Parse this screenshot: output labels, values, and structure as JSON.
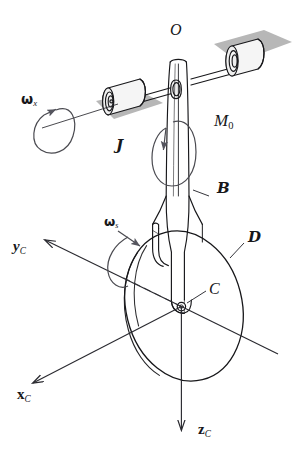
{
  "figure": {
    "background_color": "#ffffff",
    "ink_color": "#17171a",
    "shadow_color": "#b4b4b4",
    "body_fill": "#f7f7f7",
    "arrow_color": "#4a4a50"
  },
  "labels": {
    "origin": {
      "text": "O",
      "style": "italic"
    },
    "moment": {
      "symbol": "M",
      "subscript": "0"
    },
    "frame_j": {
      "text": "J",
      "style": "script"
    },
    "body_b": {
      "text": "B",
      "style": "script"
    },
    "disk_d": {
      "text": "D",
      "style": "script"
    },
    "point_c": {
      "text": "C",
      "style": "italic"
    },
    "omega_x": {
      "symbol": "ω",
      "subscript": "x"
    },
    "omega_s": {
      "symbol": "ω",
      "subscript": "s"
    },
    "axis_x": {
      "symbol": "x",
      "subscript": "C"
    },
    "axis_y": {
      "symbol": "y",
      "subscript": "C"
    },
    "axis_z": {
      "symbol": "z",
      "subscript": "C"
    }
  },
  "components": [
    {
      "name": "left-bearing-block",
      "type": "cylinder"
    },
    {
      "name": "right-bearing-block",
      "type": "cylinder"
    },
    {
      "name": "horizontal-shaft",
      "type": "rod"
    },
    {
      "name": "vertical-fork-arm",
      "type": "link"
    },
    {
      "name": "wheel-disk",
      "type": "disk"
    },
    {
      "name": "ground-shadow-left",
      "type": "shadow"
    },
    {
      "name": "ground-shadow-right",
      "type": "shadow"
    }
  ]
}
